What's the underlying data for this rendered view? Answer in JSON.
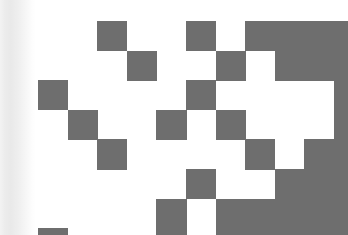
{
  "image": {
    "kind": "qr-code-fragment",
    "width": 348,
    "height": 235,
    "background_color": "#ffffff",
    "module_color": "#6e6e6e",
    "edge_shade_color": "#e9e9e9"
  },
  "grid": {
    "origin_x": 38,
    "origin_y": 21,
    "cell": 29.6,
    "cols": 11,
    "rows": 8,
    "description": "Cropped QR-style module matrix; 1 = dark module, 0 = light module.",
    "matrix": [
      [
        0,
        0,
        1,
        0,
        0,
        1,
        0,
        1,
        1,
        1,
        1
      ],
      [
        0,
        0,
        0,
        1,
        0,
        0,
        1,
        0,
        1,
        1,
        1
      ],
      [
        1,
        0,
        0,
        0,
        0,
        1,
        0,
        0,
        0,
        0,
        1
      ],
      [
        0,
        1,
        0,
        0,
        1,
        0,
        1,
        0,
        0,
        0,
        1
      ],
      [
        0,
        0,
        1,
        0,
        0,
        0,
        0,
        1,
        0,
        1,
        1
      ],
      [
        0,
        0,
        0,
        0,
        0,
        1,
        0,
        0,
        1,
        1,
        1
      ],
      [
        0,
        0,
        0,
        0,
        1,
        0,
        1,
        1,
        1,
        1,
        1
      ],
      [
        1,
        0,
        0,
        0,
        1,
        0,
        1,
        1,
        1,
        1,
        1
      ]
    ]
  },
  "overflow": {
    "description": "Dark modules that bleed past the right/bottom crop edge",
    "right_bleed_col": 11,
    "right_bleed_rows": [
      0,
      1,
      2,
      3,
      4,
      5,
      6,
      7
    ]
  }
}
